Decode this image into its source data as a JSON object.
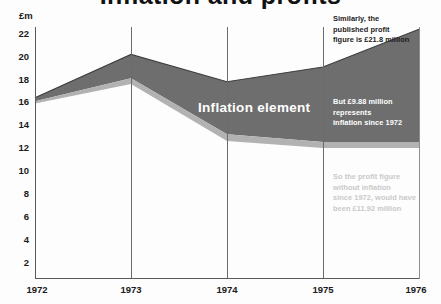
{
  "title": "Inflation and profits",
  "unit_label": "£m",
  "band_label": "Inflation element",
  "annotations": {
    "published": "Similarly, the\npublished profit\nfigure is £21.8 million",
    "inflation": "But £9.88 million\nrepresents\ninflation since 1972",
    "real": "So the profit figure\nwithout inflation\nsince 1972, would have\nbeen £11.92 million"
  },
  "colors": {
    "band_dark": "#6e6e6e",
    "band_light": "#b2b2b2",
    "axis": "#5a5a5a",
    "grid": "#6b6b6b",
    "text": "#1a1a1a",
    "background": "#fdfdfd"
  },
  "chart_data": {
    "type": "area",
    "title": "Inflation and profits",
    "xlabel": "",
    "ylabel": "£m",
    "ylim": [
      0,
      22
    ],
    "xlim": [
      "1972",
      "1976"
    ],
    "grid": true,
    "legend": "none",
    "categories": [
      "1972",
      "1973",
      "1974",
      "1975",
      "1976"
    ],
    "yticks": [
      2,
      4,
      6,
      8,
      10,
      12,
      14,
      16,
      18,
      20,
      22
    ],
    "xticks": [
      "1972",
      "1973",
      "1974",
      "1975",
      "1976"
    ],
    "series": [
      {
        "name": "Published profit (upper boundary)",
        "values": [
          15.8,
          19.6,
          17.2,
          18.5,
          21.8
        ]
      },
      {
        "name": "Real profit, top of light strip (mid boundary)",
        "values": [
          15.5,
          17.5,
          12.6,
          11.92,
          11.92
        ]
      },
      {
        "name": "Lower boundary of light strip",
        "values": [
          15.3,
          17.0,
          12.0,
          11.4,
          11.4
        ]
      }
    ],
    "annotated_values": {
      "published_profit_1976": 21.8,
      "inflation_component_1976": 9.88,
      "real_profit_1976": 11.92
    }
  }
}
